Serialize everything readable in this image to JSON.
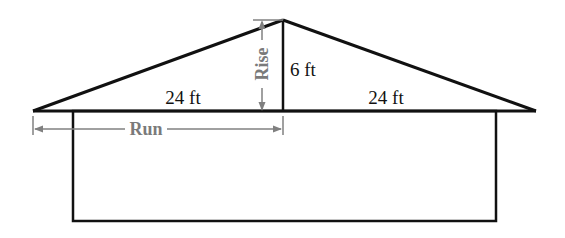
{
  "diagram": {
    "type": "roof-pitch",
    "colors": {
      "structure": "#111111",
      "dimension": "#808080",
      "background": "#ffffff"
    },
    "labels": {
      "rise_height": "6 ft",
      "left_span": "24 ft",
      "right_span": "24 ft",
      "rise": "Rise",
      "run": "Run"
    }
  }
}
